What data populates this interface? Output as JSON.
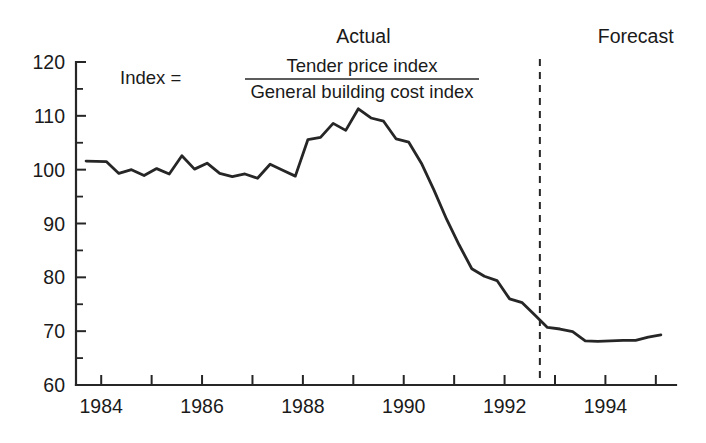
{
  "chart_data": {
    "type": "line",
    "title": "",
    "xlabel": "",
    "ylabel": "",
    "ylim": [
      60,
      120
    ],
    "xlim": [
      1983.5,
      1995.4
    ],
    "grid": false,
    "legend_position": "none",
    "y_ticks": [
      60,
      70,
      80,
      90,
      100,
      110,
      120
    ],
    "y_minor_ticks": [
      65,
      75,
      85,
      95,
      105,
      115
    ],
    "x_ticks": [
      1984,
      1985,
      1986,
      1987,
      1988,
      1989,
      1990,
      1991,
      1992,
      1993,
      1994,
      1995
    ],
    "x_tick_labels": [
      "1984",
      "",
      "1986",
      "",
      "1988",
      "",
      "1990",
      "",
      "1992",
      "",
      "1994",
      ""
    ],
    "annotations": [
      {
        "name": "actual-label",
        "text": "Actual",
        "x": 1989.2,
        "y": 123.5
      },
      {
        "name": "forecast-label",
        "text": "Forecast",
        "x": 1994.6,
        "y": 123.5
      },
      {
        "name": "forecast-divider",
        "text": "",
        "x": 1992.7,
        "y": 0
      }
    ],
    "formula": {
      "lhs": "Index  =",
      "numerator": "Tender price index",
      "denominator": "General building cost index"
    },
    "series": [
      {
        "name": "Tender price index / General building cost index",
        "x": [
          1983.7,
          1984.1,
          1984.35,
          1984.6,
          1984.85,
          1985.1,
          1985.35,
          1985.6,
          1985.85,
          1986.1,
          1986.35,
          1986.6,
          1986.85,
          1987.1,
          1987.35,
          1987.6,
          1987.85,
          1988.1,
          1988.35,
          1988.6,
          1988.85,
          1989.1,
          1989.35,
          1989.6,
          1989.85,
          1990.1,
          1990.35,
          1990.6,
          1990.85,
          1991.1,
          1991.35,
          1991.6,
          1991.85,
          1992.1,
          1992.35,
          1992.6,
          1992.85,
          1993.1,
          1993.35,
          1993.6,
          1993.85,
          1994.1,
          1994.35,
          1994.6,
          1994.85,
          1995.1
        ],
        "values": [
          101.6,
          101.5,
          99.3,
          100.0,
          98.9,
          100.2,
          99.2,
          102.6,
          100.1,
          101.2,
          99.3,
          98.7,
          99.2,
          98.4,
          101.0,
          99.9,
          98.8,
          105.6,
          106.0,
          108.6,
          107.3,
          111.3,
          109.6,
          109.0,
          105.7,
          105.1,
          101.2,
          96.2,
          90.8,
          86.0,
          81.6,
          80.2,
          79.4,
          76.0,
          75.3,
          73.0,
          70.7,
          70.4,
          69.9,
          68.2,
          68.1,
          68.2,
          68.3,
          68.3,
          68.9,
          69.3
        ]
      }
    ],
    "divider_x": 1992.7,
    "colors": {
      "line": "#262626",
      "axis": "#262626",
      "background": "#ffffff"
    }
  }
}
